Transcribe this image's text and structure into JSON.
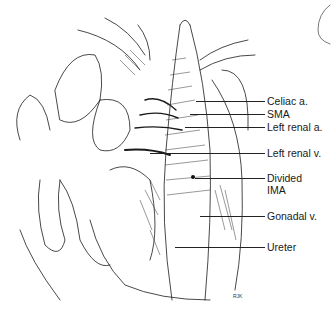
{
  "figure": {
    "labels": [
      {
        "id": "celiac",
        "text": "Celiac a.",
        "x": 267,
        "y": 95,
        "line_from": 196,
        "line_y": 101
      },
      {
        "id": "sma",
        "text": "SMA",
        "x": 267,
        "y": 108,
        "line_from": 190,
        "line_y": 114
      },
      {
        "id": "left-renal-a",
        "text": "Left renal a.",
        "x": 267,
        "y": 121,
        "line_from": 185,
        "line_y": 127
      },
      {
        "id": "left-renal-v",
        "text": "Left renal v.",
        "x": 267,
        "y": 147,
        "line_from": 150,
        "line_y": 153
      },
      {
        "id": "divided-ima",
        "text": "Divided",
        "text2": "IMA",
        "x": 267,
        "y": 172,
        "line_from": 195,
        "line_y": 178
      },
      {
        "id": "gonadal-v",
        "text": "Gonadal v.",
        "x": 267,
        "y": 210,
        "line_from": 200,
        "line_y": 216
      },
      {
        "id": "ureter",
        "text": "Ureter",
        "x": 267,
        "y": 241,
        "line_from": 175,
        "line_y": 247
      }
    ],
    "signature": "RJK"
  }
}
